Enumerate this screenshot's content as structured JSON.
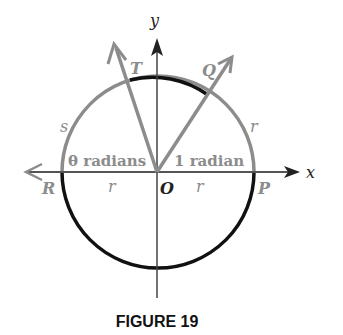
{
  "figure": {
    "caption": "FIGURE 19",
    "axes": {
      "x_label": "x",
      "y_label": "y"
    },
    "points": {
      "origin": "O",
      "P": "P",
      "Q": "Q",
      "R": "R",
      "T": "T"
    },
    "arc_labels": {
      "left_arc": "s",
      "right_arc": "r"
    },
    "radius_labels": {
      "left": "r",
      "right": "r"
    },
    "angle_labels": {
      "theta": "θ radians",
      "one": "1 radian"
    },
    "colors": {
      "gray": "#8c8c8c",
      "black": "#111111"
    }
  }
}
